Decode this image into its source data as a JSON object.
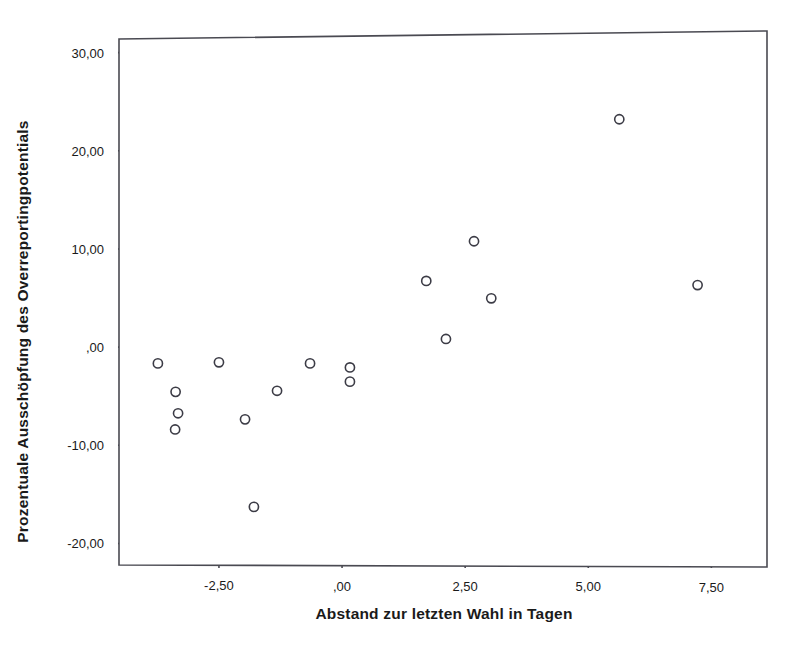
{
  "chart_data": {
    "type": "scatter",
    "title": "",
    "xlabel": "Abstand zur letzten Wahl in Tagen",
    "ylabel": "Prozentuale Ausschöpfung des Overreportingpotentials",
    "xlim": [
      -4.55,
      8.65
    ],
    "ylim": [
      -22.5,
      32.3
    ],
    "grid": false,
    "legend": null,
    "xticks": [
      -2.5,
      0.0,
      2.5,
      5.0,
      7.5
    ],
    "xtick_labels": [
      "-2,50",
      ",00",
      "2,50",
      "5,00",
      "7,50"
    ],
    "yticks": [
      30.0,
      20.0,
      10.0,
      0.0,
      -10.0,
      -20.0
    ],
    "ytick_labels": [
      "30,00",
      "20,00",
      "10,00",
      ",00",
      "-10,00",
      "-20,00"
    ],
    "marker": {
      "shape": "open-circle",
      "radius": 4.6,
      "stroke": "#3c3c46",
      "stroke_width": 1.6,
      "fill": "none"
    },
    "frame_color": "#4a4a52",
    "background": "#ffffff",
    "points": [
      {
        "x": -3.74,
        "y": -1.66
      },
      {
        "x": -3.38,
        "y": -4.56
      },
      {
        "x": -3.33,
        "y": -6.74
      },
      {
        "x": -3.39,
        "y": -8.39
      },
      {
        "x": -2.5,
        "y": -1.55
      },
      {
        "x": -1.97,
        "y": -7.36
      },
      {
        "x": -1.79,
        "y": -16.27
      },
      {
        "x": -1.32,
        "y": -4.45
      },
      {
        "x": -0.65,
        "y": -1.66
      },
      {
        "x": 0.16,
        "y": -2.07
      },
      {
        "x": 0.16,
        "y": -3.52
      },
      {
        "x": 1.71,
        "y": 6.74
      },
      {
        "x": 2.11,
        "y": 0.83
      },
      {
        "x": 2.68,
        "y": 10.78
      },
      {
        "x": 3.03,
        "y": 4.97
      },
      {
        "x": 5.63,
        "y": 23.21
      },
      {
        "x": 7.22,
        "y": 6.32
      }
    ]
  },
  "axes": {
    "y_title": "Prozentuale Ausschöpfung des Overreportingpotentials",
    "x_title": "Abstand zur letzten Wahl in Tagen"
  }
}
